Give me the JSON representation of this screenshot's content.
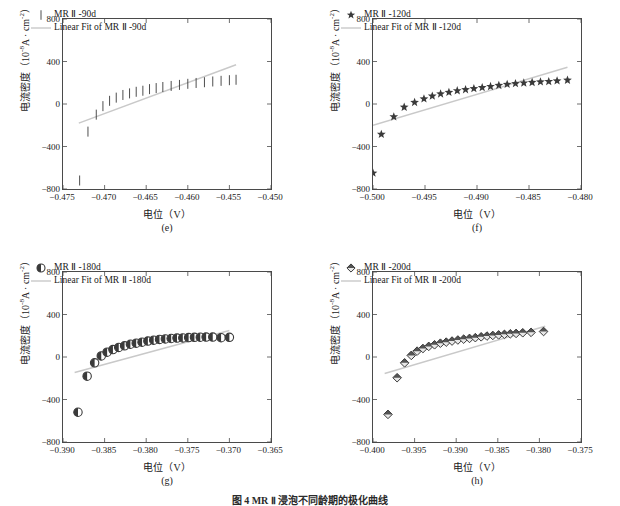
{
  "figure": {
    "caption": "图 4  MR Ⅱ 浸泡不同龄期的极化曲线",
    "axis_titles": {
      "x": "电位（V）",
      "y_main": "电流密度（10",
      "y_exp": "-8",
      "y_tail": "A · cm",
      "y_exp2": "-2",
      "y_close": "）"
    }
  },
  "chart_data": [
    {
      "type": "scatter",
      "panel": "e",
      "tag": "(e)",
      "title": "",
      "xlabel": "电位（V）",
      "ylabel": "电流密度（10⁻⁸A · cm⁻²）",
      "xlim": [
        -0.475,
        -0.45
      ],
      "ylim": [
        -800,
        800
      ],
      "xticks": [
        -0.475,
        -0.47,
        -0.465,
        -0.46,
        -0.455,
        -0.45
      ],
      "xtick_labels": [
        "-0.475",
        "-0.470",
        "-0.465",
        "-0.460",
        "-0.455",
        "-0.450"
      ],
      "yticks": [
        -800,
        -400,
        0,
        400,
        800
      ],
      "ytick_labels": [
        "-800",
        "-400",
        "0",
        "400",
        "800"
      ],
      "grid": false,
      "marker": "vbar",
      "legend_position": "upper-left",
      "legend": [
        "MR Ⅱ -90d",
        "Linear Fit of MR Ⅱ -90d"
      ],
      "series": [
        {
          "name": "MR Ⅱ -90d",
          "x": [
            -0.473,
            -0.472,
            -0.471,
            -0.4702,
            -0.4694,
            -0.4686,
            -0.4678,
            -0.467,
            -0.4662,
            -0.4654,
            -0.4646,
            -0.4638,
            -0.463,
            -0.462,
            -0.461,
            -0.46,
            -0.459,
            -0.458,
            -0.457,
            -0.456,
            -0.455,
            -0.4542
          ],
          "y": [
            -720,
            -260,
            -100,
            -20,
            30,
            60,
            85,
            100,
            115,
            125,
            140,
            150,
            160,
            170,
            180,
            190,
            198,
            205,
            212,
            218,
            224,
            228
          ]
        }
      ],
      "fit_line": {
        "name": "Linear Fit of MR Ⅱ -90d",
        "x": [
          -0.4731,
          -0.4542
        ],
        "y": [
          -180,
          370
        ]
      }
    },
    {
      "type": "scatter",
      "panel": "f",
      "tag": "(f)",
      "title": "",
      "xlabel": "电位（V）",
      "ylabel": "电流密度（10⁻⁸A · cm⁻²）",
      "xlim": [
        -0.5,
        -0.48
      ],
      "ylim": [
        -800,
        800
      ],
      "xticks": [
        -0.5,
        -0.495,
        -0.49,
        -0.485,
        -0.48
      ],
      "xtick_labels": [
        "-0.500",
        "-0.495",
        "-0.490",
        "-0.485",
        "-0.480"
      ],
      "yticks": [
        -800,
        -400,
        0,
        400,
        800
      ],
      "ytick_labels": [
        "-800",
        "-400",
        "0",
        "400",
        "800"
      ],
      "grid": false,
      "marker": "star",
      "legend_position": "upper-left",
      "legend": [
        "MR Ⅱ -120d",
        "Linear Fit of MR Ⅱ -120d"
      ],
      "series": [
        {
          "name": "MR Ⅱ -120d",
          "x": [
            -0.5,
            -0.4992,
            -0.498,
            -0.497,
            -0.496,
            -0.4951,
            -0.4943,
            -0.4935,
            -0.4927,
            -0.4919,
            -0.4911,
            -0.4903,
            -0.4895,
            -0.4887,
            -0.4879,
            -0.4871,
            -0.4863,
            -0.4855,
            -0.4847,
            -0.4839,
            -0.4831,
            -0.4823,
            -0.4813
          ],
          "y": [
            -650,
            -285,
            -120,
            -30,
            15,
            48,
            75,
            95,
            110,
            125,
            135,
            145,
            155,
            165,
            175,
            185,
            192,
            198,
            203,
            208,
            212,
            218,
            224
          ]
        }
      ],
      "fit_line": {
        "name": "Linear Fit of MR Ⅱ -120d",
        "x": [
          -0.5,
          -0.4813
        ],
        "y": [
          -200,
          345
        ]
      }
    },
    {
      "type": "scatter",
      "panel": "g",
      "tag": "(g)",
      "title": "",
      "xlabel": "电位（V）",
      "ylabel": "电流密度（10⁻⁸A · cm⁻²）",
      "xlim": [
        -0.39,
        -0.365
      ],
      "ylim": [
        -800,
        800
      ],
      "xticks": [
        -0.39,
        -0.385,
        -0.38,
        -0.375,
        -0.37,
        -0.365
      ],
      "xtick_labels": [
        "-0.390",
        "-0.385",
        "-0.380",
        "-0.375",
        "-0.370",
        "-0.365"
      ],
      "yticks": [
        -800,
        -400,
        0,
        400,
        800
      ],
      "ytick_labels": [
        "-800",
        "-400",
        "0",
        "400",
        "800"
      ],
      "grid": false,
      "marker": "halfcircle",
      "legend_position": "upper-left",
      "legend": [
        "MR Ⅱ -180d",
        "Linear Fit of MR Ⅱ -180d"
      ],
      "series": [
        {
          "name": "MR Ⅱ -180d",
          "x": [
            -0.3882,
            -0.3871,
            -0.3862,
            -0.3854,
            -0.3847,
            -0.384,
            -0.3833,
            -0.3826,
            -0.3819,
            -0.3812,
            -0.3805,
            -0.3798,
            -0.3791,
            -0.3784,
            -0.3777,
            -0.377,
            -0.3763,
            -0.3756,
            -0.3749,
            -0.3742,
            -0.3735,
            -0.3728,
            -0.372,
            -0.371,
            -0.37
          ],
          "y": [
            -520,
            -180,
            -55,
            10,
            45,
            70,
            90,
            105,
            120,
            130,
            140,
            150,
            158,
            165,
            170,
            174,
            178,
            180,
            183,
            185,
            186,
            188,
            188,
            182,
            185
          ]
        }
      ],
      "fit_line": {
        "name": "Linear Fit of MR Ⅱ -180d",
        "x": [
          -0.3886,
          -0.37
        ],
        "y": [
          -145,
          250
        ]
      }
    },
    {
      "type": "scatter",
      "panel": "h",
      "tag": "(h)",
      "title": "",
      "xlabel": "电位（V）",
      "ylabel": "电流密度（10⁻⁸A · cm⁻²）",
      "xlim": [
        -0.4,
        -0.375
      ],
      "ylim": [
        -800,
        800
      ],
      "xticks": [
        -0.4,
        -0.395,
        -0.39,
        -0.385,
        -0.38,
        -0.375
      ],
      "xtick_labels": [
        "-0.400",
        "-0.395",
        "-0.390",
        "-0.385",
        "-0.380",
        "-0.375"
      ],
      "yticks": [
        -800,
        -400,
        0,
        400,
        800
      ],
      "ytick_labels": [
        "-800",
        "-400",
        "0",
        "400",
        "800"
      ],
      "grid": false,
      "marker": "diamond",
      "legend_position": "upper-left",
      "legend": [
        "MR Ⅱ -200d",
        "Linear Fit of MR Ⅱ -200d"
      ],
      "series": [
        {
          "name": "MR Ⅱ -200d",
          "x": [
            -0.3982,
            -0.3971,
            -0.3962,
            -0.3954,
            -0.3947,
            -0.394,
            -0.3933,
            -0.3926,
            -0.3919,
            -0.3912,
            -0.3905,
            -0.3898,
            -0.3891,
            -0.3884,
            -0.3877,
            -0.387,
            -0.3863,
            -0.3856,
            -0.3849,
            -0.3842,
            -0.3835,
            -0.3828,
            -0.382,
            -0.381,
            -0.3795
          ],
          "y": [
            -540,
            -195,
            -55,
            15,
            55,
            80,
            100,
            115,
            130,
            140,
            150,
            160,
            168,
            175,
            182,
            190,
            197,
            203,
            208,
            213,
            218,
            222,
            228,
            232,
            240
          ]
        }
      ],
      "fit_line": {
        "name": "Linear Fit of MR Ⅱ -200d",
        "x": [
          -0.3986,
          -0.3793
        ],
        "y": [
          -155,
          290
        ]
      }
    }
  ],
  "colors": {
    "axis": "#4a4a4a",
    "marker": "#3a3a3a",
    "fit_line": "#c9c9c9",
    "text": "#1a1a1a"
  }
}
